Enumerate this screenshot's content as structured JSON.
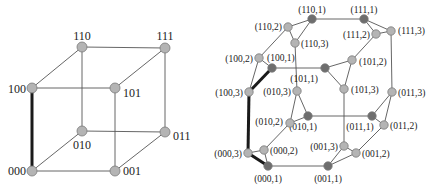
{
  "left_graph": {
    "title": "3-cube",
    "nodes": [
      {
        "id": "000",
        "label": "000",
        "x": 32,
        "y": 171,
        "lx": 26,
        "ly": 175,
        "anchor": "end"
      },
      {
        "id": "001",
        "label": "001",
        "x": 115,
        "y": 171,
        "lx": 123,
        "ly": 175,
        "anchor": "start"
      },
      {
        "id": "010",
        "label": "010",
        "x": 82,
        "y": 131,
        "lx": 82,
        "ly": 149,
        "anchor": "middle"
      },
      {
        "id": "011",
        "label": "011",
        "x": 165,
        "y": 132,
        "lx": 173,
        "ly": 140,
        "anchor": "start"
      },
      {
        "id": "100",
        "label": "100",
        "x": 32,
        "y": 88,
        "lx": 26,
        "ly": 93,
        "anchor": "end"
      },
      {
        "id": "101",
        "label": "101",
        "x": 115,
        "y": 88,
        "lx": 123,
        "ly": 97,
        "anchor": "start"
      },
      {
        "id": "110",
        "label": "110",
        "x": 82,
        "y": 47,
        "lx": 82,
        "ly": 40,
        "anchor": "middle"
      },
      {
        "id": "111",
        "label": "111",
        "x": 165,
        "y": 48,
        "lx": 165,
        "ly": 40,
        "anchor": "middle"
      }
    ],
    "edges": [
      [
        "000",
        "001"
      ],
      [
        "000",
        "010"
      ],
      [
        "001",
        "011"
      ],
      [
        "010",
        "011"
      ],
      [
        "100",
        "101"
      ],
      [
        "100",
        "110"
      ],
      [
        "101",
        "111"
      ],
      [
        "110",
        "111"
      ],
      [
        "001",
        "101"
      ],
      [
        "010",
        "110"
      ],
      [
        "011",
        "111"
      ]
    ],
    "thick_edges": [
      [
        "000",
        "100"
      ]
    ]
  },
  "right_graph": {
    "title": "cube-connected cycles CCC(3)",
    "nodes": [
      {
        "id": "110,1",
        "label": "(110,1)",
        "x": 312,
        "y": 19,
        "dark": true,
        "lx": 312,
        "ly": 13,
        "anchor": "middle"
      },
      {
        "id": "111,1",
        "label": "(111,1)",
        "x": 364,
        "y": 19,
        "dark": true,
        "lx": 364,
        "ly": 13,
        "anchor": "middle"
      },
      {
        "id": "110,2",
        "label": "(110,2)",
        "x": 288,
        "y": 27,
        "dark": false,
        "lx": 282,
        "ly": 30,
        "anchor": "end"
      },
      {
        "id": "111,2",
        "label": "(111,2)",
        "x": 376,
        "y": 34,
        "dark": false,
        "lx": 370,
        "ly": 38,
        "anchor": "end"
      },
      {
        "id": "111,3",
        "label": "(111,3)",
        "x": 391,
        "y": 31,
        "dark": false,
        "lx": 398,
        "ly": 34,
        "anchor": "start"
      },
      {
        "id": "110,3",
        "label": "(110,3)",
        "x": 295,
        "y": 43,
        "dark": false,
        "lx": 301,
        "ly": 47,
        "anchor": "start"
      },
      {
        "id": "100,2",
        "label": "(100,2)",
        "x": 259,
        "y": 58,
        "dark": false,
        "lx": 253,
        "ly": 62,
        "anchor": "end"
      },
      {
        "id": "100,1",
        "label": "(100,1)",
        "x": 272,
        "y": 68,
        "dark": true,
        "lx": 267,
        "ly": 61,
        "anchor": "start"
      },
      {
        "id": "101,1",
        "label": "(101,1)",
        "x": 325,
        "y": 68,
        "dark": true,
        "lx": 318,
        "ly": 82,
        "anchor": "end"
      },
      {
        "id": "101,2",
        "label": "(101,2)",
        "x": 352,
        "y": 60,
        "dark": false,
        "lx": 359,
        "ly": 65,
        "anchor": "start"
      },
      {
        "id": "100,3",
        "label": "(100,3)",
        "x": 249,
        "y": 92,
        "dark": false,
        "lx": 243,
        "ly": 96,
        "anchor": "end"
      },
      {
        "id": "010,3",
        "label": "(010,3)",
        "x": 297,
        "y": 91,
        "dark": false,
        "lx": 291,
        "ly": 95,
        "anchor": "end"
      },
      {
        "id": "101,3",
        "label": "(101,3)",
        "x": 344,
        "y": 89,
        "dark": false,
        "lx": 351,
        "ly": 93,
        "anchor": "start"
      },
      {
        "id": "011,3",
        "label": "(011,3)",
        "x": 392,
        "y": 92,
        "dark": false,
        "lx": 398,
        "ly": 96,
        "anchor": "start"
      },
      {
        "id": "010,1",
        "label": "(010,1)",
        "x": 308,
        "y": 116,
        "dark": true,
        "lx": 303,
        "ly": 130,
        "anchor": "middle"
      },
      {
        "id": "010,2",
        "label": "(010,2)",
        "x": 290,
        "y": 123,
        "dark": false,
        "lx": 283,
        "ly": 125,
        "anchor": "end"
      },
      {
        "id": "011,1",
        "label": "(011,1)",
        "x": 372,
        "y": 116,
        "dark": true,
        "lx": 360,
        "ly": 130,
        "anchor": "middle"
      },
      {
        "id": "011,2",
        "label": "(011,2)",
        "x": 384,
        "y": 125,
        "dark": false,
        "lx": 390,
        "ly": 129,
        "anchor": "start"
      },
      {
        "id": "000,3",
        "label": "(000,3)",
        "x": 248,
        "y": 153,
        "dark": false,
        "lx": 242,
        "ly": 157,
        "anchor": "end"
      },
      {
        "id": "000,2",
        "label": "(000,2)",
        "x": 264,
        "y": 150,
        "dark": false,
        "lx": 270,
        "ly": 154,
        "anchor": "start"
      },
      {
        "id": "001,3",
        "label": "(001,3)",
        "x": 344,
        "y": 146,
        "dark": false,
        "lx": 338,
        "ly": 150,
        "anchor": "end"
      },
      {
        "id": "001,2",
        "label": "(001,2)",
        "x": 356,
        "y": 153,
        "dark": false,
        "lx": 362,
        "ly": 157,
        "anchor": "start"
      },
      {
        "id": "000,1",
        "label": "(000,1)",
        "x": 268,
        "y": 166,
        "dark": true,
        "lx": 268,
        "ly": 182,
        "anchor": "middle"
      },
      {
        "id": "001,1",
        "label": "(001,1)",
        "x": 328,
        "y": 166,
        "dark": true,
        "lx": 328,
        "ly": 182,
        "anchor": "middle"
      }
    ],
    "edges": [
      [
        "000,1",
        "000,2"
      ],
      [
        "000,2",
        "000,3"
      ],
      [
        "001,1",
        "001,2"
      ],
      [
        "001,2",
        "001,3"
      ],
      [
        "001,3",
        "001,1"
      ],
      [
        "010,1",
        "010,2"
      ],
      [
        "010,2",
        "010,3"
      ],
      [
        "010,3",
        "010,1"
      ],
      [
        "011,1",
        "011,2"
      ],
      [
        "011,2",
        "011,3"
      ],
      [
        "011,3",
        "011,1"
      ],
      [
        "100,1",
        "100,2"
      ],
      [
        "100,2",
        "100,3"
      ],
      [
        "101,1",
        "101,2"
      ],
      [
        "101,2",
        "101,3"
      ],
      [
        "101,3",
        "101,1"
      ],
      [
        "110,1",
        "110,2"
      ],
      [
        "110,2",
        "110,3"
      ],
      [
        "110,3",
        "110,1"
      ],
      [
        "111,1",
        "111,2"
      ],
      [
        "111,2",
        "111,3"
      ],
      [
        "111,3",
        "111,1"
      ],
      [
        "000,1",
        "001,1"
      ],
      [
        "010,1",
        "011,1"
      ],
      [
        "100,1",
        "101,1"
      ],
      [
        "110,1",
        "111,1"
      ],
      [
        "000,2",
        "010,2"
      ],
      [
        "001,2",
        "011,2"
      ],
      [
        "100,2",
        "110,2"
      ],
      [
        "101,2",
        "111,2"
      ],
      [
        "001,3",
        "101,3"
      ],
      [
        "010,3",
        "110,3"
      ],
      [
        "011,3",
        "111,3"
      ]
    ],
    "thick_edges": [
      [
        "000,3",
        "100,3"
      ],
      [
        "000,3",
        "000,1"
      ],
      [
        "100,3",
        "100,1"
      ]
    ]
  },
  "colors": {
    "edge": "#555555",
    "thick_edge": "#1a1a1a",
    "node_light": "#b4b4b4",
    "node_dark": "#6e6e6e",
    "node_stroke": "#7a7a7a"
  }
}
